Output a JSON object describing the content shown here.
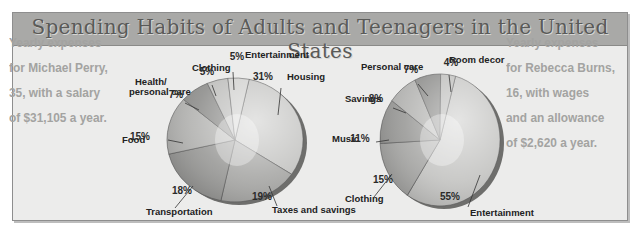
{
  "title": "Spending Habits of Adults and Teenagers in the United States",
  "captions": {
    "left": [
      "Yearly expenses",
      "for Michael Perry,",
      "35, with a salary",
      "of $31,105 a year."
    ],
    "right": [
      "Yearly expenses",
      "for Rebecca Burns,",
      "16, with wages",
      "and an allowance",
      "of $2,620 a year."
    ]
  },
  "chart_data": [
    {
      "type": "pie",
      "title": "Yearly expenses for Michael Perry, 35, with a salary of $31,105 a year.",
      "categories": [
        "Housing",
        "Taxes and savings",
        "Transportation",
        "Food",
        "Health/ personal care",
        "Clothing",
        "Entertainment"
      ],
      "values": [
        31,
        19,
        18,
        15,
        7,
        5,
        5
      ],
      "unit": "%",
      "center": [
        235,
        140
      ],
      "radius": [
        68,
        62
      ],
      "labels": [
        {
          "name": "Housing",
          "lx": 287,
          "ly": 80,
          "px": 278,
          "py": 115,
          "tx": 263,
          "ty": 80,
          "lax": 281,
          "lay": 88
        },
        {
          "name": "Taxes and savings",
          "lx": 272,
          "ly": 213,
          "px": 269,
          "py": 186,
          "tx": 262,
          "ty": 200,
          "lax": 277,
          "lay": 206
        },
        {
          "name": "Transportation",
          "lx": 146,
          "ly": 215,
          "px": 193,
          "py": 186,
          "tx": 182,
          "ty": 194,
          "lax": 175,
          "lay": 208
        },
        {
          "name": "Food",
          "lx": 122,
          "ly": 143,
          "px": 183,
          "py": 143,
          "tx": 140,
          "ty": 140,
          "lax": 168,
          "lay": 140
        },
        {
          "name": "Health/",
          "name2": "personal care",
          "lx": 135,
          "ly": 85,
          "px": 199,
          "py": 110,
          "tx": 176,
          "ty": 98,
          "lax": 185,
          "lay": 103
        },
        {
          "name": "Clothing",
          "lx": 192,
          "ly": 71,
          "px": 216,
          "py": 96,
          "tx": 207,
          "ty": 75,
          "lax": 212,
          "lay": 85
        },
        {
          "name": "Entertainment",
          "lx": 245,
          "ly": 58,
          "px": 234,
          "py": 90,
          "tx": 237,
          "ty": 60,
          "lax": 233,
          "lay": 72
        }
      ]
    },
    {
      "type": "pie",
      "title": "Yearly expenses for Rebecca Burns, 16, with wages and an allowance of $2,620 a year.",
      "categories": [
        "Entertainment",
        "Clothing",
        "Music",
        "Savings",
        "Personal care",
        "Room decor"
      ],
      "values": [
        55,
        15,
        11,
        8,
        7,
        4
      ],
      "unit": "%",
      "center": [
        440,
        140
      ],
      "radius": [
        60,
        66
      ],
      "labels": [
        {
          "name": "Entertainment",
          "lx": 470,
          "ly": 216,
          "px": 480,
          "py": 175,
          "tx": 450,
          "ty": 200,
          "lax": 468,
          "lay": 207
        },
        {
          "name": "Clothing",
          "lx": 345,
          "ly": 202,
          "px": 392,
          "py": 174,
          "tx": 383,
          "ty": 183,
          "lax": 374,
          "lay": 197
        },
        {
          "name": "Music",
          "lx": 332,
          "ly": 142,
          "px": 389,
          "py": 140,
          "tx": 360,
          "ty": 142,
          "lax": 376,
          "lay": 142
        },
        {
          "name": "Savings",
          "lx": 345,
          "ly": 102,
          "px": 406,
          "py": 113,
          "tx": 376,
          "ty": 102,
          "lax": 393,
          "lay": 108
        },
        {
          "name": "Personal care",
          "lx": 361,
          "ly": 70,
          "px": 428,
          "py": 96,
          "tx": 411,
          "ty": 73,
          "lax": 418,
          "lay": 84
        },
        {
          "name": "Room decor",
          "lx": 449,
          "ly": 63,
          "px": 451,
          "py": 92,
          "tx": 451,
          "ty": 66,
          "lax": 449,
          "lay": 75
        }
      ]
    }
  ],
  "colors": {
    "frame_bg": "#ececeb",
    "title_bar": "#a9a9a7",
    "caption_text": "#a3a3a1",
    "slice_dark": "#8f8f8d",
    "slice_mid": "#b5b5b3",
    "slice_light": "#d4d4d2",
    "rim": "#6e6e6c"
  }
}
